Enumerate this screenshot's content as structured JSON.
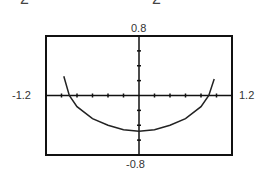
{
  "fragments": {
    "left": "2",
    "right": "2"
  },
  "chart_data": {
    "type": "line",
    "title": "",
    "xlabel": "",
    "ylabel": "",
    "xlim": [
      -1.2,
      1.2
    ],
    "ylim": [
      -0.8,
      0.8
    ],
    "xtick_step": 0.2,
    "ytick_step": 0.2,
    "grid": false,
    "window_labels": {
      "xmin": "-1.2",
      "xmax": "1.2",
      "ymax": "0.8",
      "ymin": "-0.8"
    },
    "series": [
      {
        "name": "curve",
        "x": [
          -0.97,
          -0.9,
          -0.8,
          -0.6,
          -0.4,
          -0.2,
          0.0,
          0.2,
          0.4,
          0.6,
          0.8,
          0.9,
          0.97
        ],
        "y": [
          0.26,
          0.0,
          -0.15,
          -0.31,
          -0.4,
          -0.46,
          -0.48,
          -0.46,
          -0.4,
          -0.31,
          -0.15,
          0.0,
          0.22
        ]
      }
    ]
  }
}
